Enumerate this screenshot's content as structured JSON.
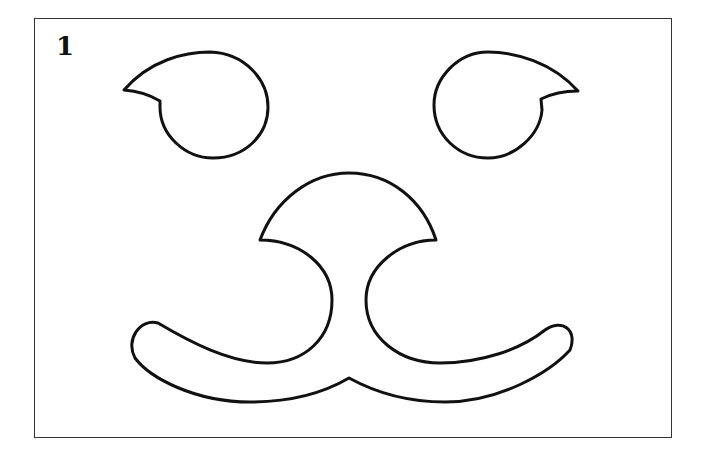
{
  "figure": {
    "number_label": "1",
    "colors": {
      "stroke": "#111111",
      "frame": "#333333",
      "background": "#ffffff"
    }
  }
}
